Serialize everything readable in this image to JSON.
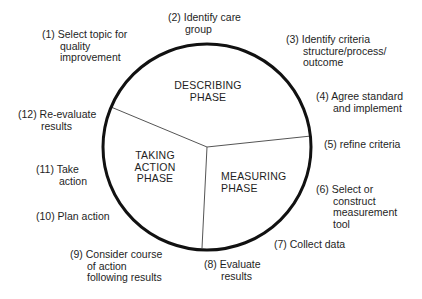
{
  "diagram": {
    "type": "cycle",
    "circle": {
      "cx": 207,
      "cy": 147,
      "r": 103,
      "stroke": "#111111",
      "stroke_width": 3
    },
    "dividers": {
      "color": "#555555",
      "center": [
        207,
        147
      ],
      "ends": [
        [
          111,
          107
        ],
        [
          311,
          136
        ],
        [
          202,
          248
        ]
      ]
    },
    "phases": [
      {
        "id": "describing",
        "lines": [
          "DESCRIBING",
          "PHASE"
        ]
      },
      {
        "id": "taking-action",
        "lines": [
          "TAKING",
          "ACTION",
          "PHASE"
        ]
      },
      {
        "id": "measuring",
        "lines": [
          "MEASURING",
          "PHASE"
        ]
      }
    ],
    "steps": [
      {
        "num": "(1)",
        "lines": [
          "Select topic for",
          "quality",
          "improvement"
        ]
      },
      {
        "num": "(2)",
        "lines": [
          "Identify care",
          "group"
        ]
      },
      {
        "num": "(3)",
        "lines": [
          "Identify criteria",
          "structure/process/",
          "outcome"
        ]
      },
      {
        "num": "(4)",
        "lines": [
          "Agree standard",
          "and implement"
        ]
      },
      {
        "num": "(5)",
        "lines": [
          "refine criteria"
        ]
      },
      {
        "num": "(6)",
        "lines": [
          "Select or",
          "construct",
          "measurement",
          "tool"
        ]
      },
      {
        "num": "(7)",
        "lines": [
          "Collect data"
        ]
      },
      {
        "num": "(8)",
        "lines": [
          "Evaluate",
          "results"
        ]
      },
      {
        "num": "(9)",
        "lines": [
          "Consider course",
          "of action",
          "following results"
        ]
      },
      {
        "num": "(10)",
        "lines": [
          "Plan action"
        ]
      },
      {
        "num": "(11)",
        "lines": [
          "Take",
          "action"
        ]
      },
      {
        "num": "(12)",
        "lines": [
          "Re-evaluate",
          "results"
        ]
      }
    ]
  }
}
